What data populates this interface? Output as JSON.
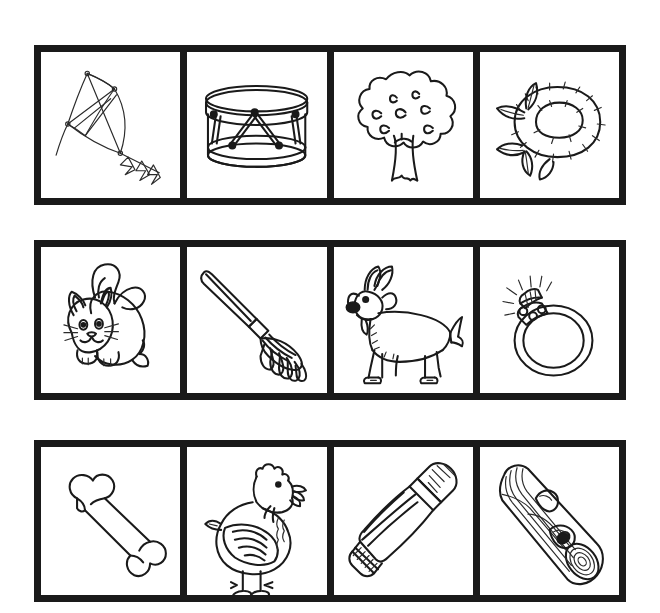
{
  "page": {
    "background_color": "#ffffff",
    "border_color": "#1a1a1a",
    "ink_color": "#1a1a1a",
    "style": "black and white line art clip art",
    "rows": 3,
    "columns": 4
  },
  "grid": {
    "rows": [
      {
        "row_label": "row-1",
        "cells": [
          {
            "index": 1,
            "icon": "kite-icon",
            "label": "Kite"
          },
          {
            "index": 2,
            "icon": "drum-icon",
            "label": "Drum"
          },
          {
            "index": 3,
            "icon": "tree-icon",
            "label": "Tree"
          },
          {
            "index": 4,
            "icon": "nest-icon",
            "label": "Nest"
          }
        ]
      },
      {
        "row_label": "row-2",
        "cells": [
          {
            "index": 1,
            "icon": "cat-icon",
            "label": "Cat"
          },
          {
            "index": 2,
            "icon": "rake-icon",
            "label": "Rake"
          },
          {
            "index": 3,
            "icon": "goat-icon",
            "label": "Goat"
          },
          {
            "index": 4,
            "icon": "ring-icon",
            "label": "Ring"
          }
        ]
      },
      {
        "row_label": "row-3",
        "cells": [
          {
            "index": 1,
            "icon": "bone-icon",
            "label": "Bone"
          },
          {
            "index": 2,
            "icon": "hen-icon",
            "label": "Hen"
          },
          {
            "index": 3,
            "icon": "toothpaste-tube-icon",
            "label": "Toothpaste tube"
          },
          {
            "index": 4,
            "icon": "log-icon",
            "label": "Log"
          }
        ]
      }
    ]
  }
}
